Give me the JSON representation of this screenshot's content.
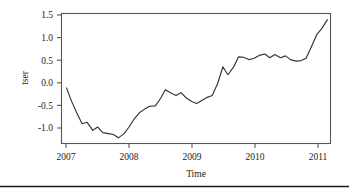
{
  "figure": {
    "background_color": "#ffffff",
    "line_color": "#333333",
    "axis_color": "#555555",
    "rule_color": "#1b1b1b"
  },
  "chart_data": {
    "type": "line",
    "title": "",
    "xlabel": "Time",
    "ylabel": "tser",
    "xlim": [
      2006.92,
      2011.22
    ],
    "ylim": [
      -1.18,
      1.58
    ],
    "grid": false,
    "legend": null,
    "xticks": [
      2007,
      2008,
      2009,
      2010,
      2011
    ],
    "xtick_labels": [
      "2007",
      "2008",
      "2009",
      "2010",
      "2011"
    ],
    "yticks": [
      -1.0,
      -0.5,
      0.0,
      0.5,
      1.0,
      1.5
    ],
    "ytick_labels": [
      "-1.0",
      "-0.5",
      "0.0",
      "0.5",
      "1.0",
      "1.5"
    ],
    "series": [
      {
        "name": "tser",
        "color": "#333333",
        "x": [
          2007.0,
          2007.08,
          2007.17,
          2007.25,
          2007.33,
          2007.42,
          2007.5,
          2007.58,
          2007.67,
          2007.75,
          2007.83,
          2007.92,
          2008.0,
          2008.08,
          2008.17,
          2008.25,
          2008.33,
          2008.42,
          2008.5,
          2008.58,
          2008.67,
          2008.75,
          2008.83,
          2008.92,
          2009.0,
          2009.08,
          2009.17,
          2009.25,
          2009.33,
          2009.42,
          2009.5,
          2009.58,
          2009.67,
          2009.75,
          2009.83,
          2009.92,
          2010.0,
          2010.08,
          2010.17,
          2010.25,
          2010.33,
          2010.42,
          2010.5,
          2010.58,
          2010.67,
          2010.75,
          2010.83,
          2010.92,
          2011.0,
          2011.08,
          2011.17
        ],
        "y": [
          0.0,
          -0.28,
          -0.55,
          -0.76,
          -0.73,
          -0.9,
          -0.83,
          -0.95,
          -0.97,
          -0.99,
          -1.06,
          -0.97,
          -0.83,
          -0.66,
          -0.52,
          -0.45,
          -0.39,
          -0.38,
          -0.23,
          -0.04,
          -0.11,
          -0.16,
          -0.1,
          -0.22,
          -0.29,
          -0.33,
          -0.26,
          -0.2,
          -0.16,
          0.11,
          0.45,
          0.28,
          0.44,
          0.66,
          0.65,
          0.6,
          0.63,
          0.69,
          0.72,
          0.64,
          0.71,
          0.64,
          0.68,
          0.6,
          0.57,
          0.58,
          0.63,
          0.89,
          1.13,
          1.26,
          1.45
        ]
      }
    ]
  },
  "labels": {
    "y_axis_title": "tser",
    "x_axis_title": "Time"
  }
}
